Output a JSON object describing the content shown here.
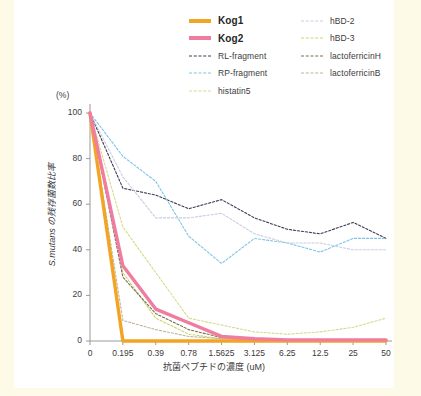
{
  "chart_data": {
    "type": "line",
    "title": "",
    "xlabel": "抗菌ペプチドの濃度 (uM)",
    "ylabel": "S.mutans の残存菌数比率",
    "y_unit": "(%)",
    "categories": [
      "0",
      "0.195",
      "0.39",
      "0.78",
      "1.5625",
      "3.125",
      "6.25",
      "12.5",
      "25",
      "50"
    ],
    "x_numeric": [
      0,
      0.195,
      0.39,
      0.78,
      1.5625,
      3.125,
      6.25,
      12.5,
      25,
      50
    ],
    "ylim": [
      0,
      100
    ],
    "yticks": [
      0,
      20,
      40,
      60,
      80,
      100
    ],
    "grid": false,
    "legend_position": "top-right",
    "series": [
      {
        "name": "Kog1",
        "color": "#F2A425",
        "style": "solid",
        "width": 3.4,
        "emphasis": true,
        "values": [
          100,
          0,
          0,
          0,
          0,
          0,
          0,
          0,
          0,
          0
        ]
      },
      {
        "name": "Kog2",
        "color": "#F07CA0",
        "style": "solid",
        "width": 3.4,
        "emphasis": true,
        "values": [
          100,
          33,
          14,
          8,
          2,
          1,
          0.5,
          0.5,
          0.5,
          0.5
        ]
      },
      {
        "name": "RL-fragment",
        "color": "#3F3B52",
        "style": "dashed",
        "width": 1.1,
        "emphasis": false,
        "values": [
          100,
          67,
          64,
          58,
          62,
          54,
          49,
          47,
          52,
          45
        ]
      },
      {
        "name": "RP-fragment",
        "color": "#7FC4E8",
        "style": "dashed",
        "width": 1.1,
        "emphasis": false,
        "values": [
          100,
          81,
          70,
          46,
          34,
          45,
          43,
          39,
          45,
          45
        ]
      },
      {
        "name": "histatin5",
        "color": "#D7DB8A",
        "style": "dashed",
        "width": 1.1,
        "emphasis": false,
        "values": [
          100,
          50,
          30,
          10,
          7,
          4,
          3,
          4,
          6,
          10
        ]
      },
      {
        "name": "hBD-2",
        "color": "#C8CEE2",
        "style": "dashed",
        "width": 1.1,
        "emphasis": false,
        "values": [
          100,
          72,
          54,
          54,
          56,
          47,
          43,
          43,
          40,
          40
        ]
      },
      {
        "name": "hBD-3",
        "color": "#C9D66B",
        "style": "dashed",
        "width": 1.1,
        "emphasis": false,
        "values": [
          100,
          30,
          10,
          3,
          1,
          0.5,
          0.5,
          0.5,
          0.5,
          0.5
        ]
      },
      {
        "name": "lactoferricinH",
        "color": "#7A6E4E",
        "style": "dashed",
        "width": 1.1,
        "emphasis": false,
        "values": [
          100,
          28,
          12,
          5,
          1.5,
          0.8,
          0.5,
          0.5,
          0.5,
          0.5
        ]
      },
      {
        "name": "lactoferricinB",
        "color": "#C0B49A",
        "style": "dashed",
        "width": 1.1,
        "emphasis": false,
        "values": [
          100,
          9,
          5,
          2,
          1,
          0.5,
          0.5,
          0.5,
          0.5,
          0.5
        ]
      }
    ]
  },
  "legend": {
    "columns": [
      {
        "items": [
          {
            "label": "Kog1",
            "color": "#F2A425",
            "style": "solid",
            "bold": true
          },
          {
            "label": "Kog2",
            "color": "#F07CA0",
            "style": "solid",
            "bold": true
          },
          {
            "label": "RL-fragment",
            "color": "#3F3B52",
            "style": "dashed",
            "bold": false
          },
          {
            "label": "RP-fragment",
            "color": "#7FC4E8",
            "style": "dashed",
            "bold": false
          },
          {
            "label": "histatin5",
            "color": "#D7DB8A",
            "style": "dashed",
            "bold": false
          }
        ]
      },
      {
        "items": [
          {
            "label": "hBD-2",
            "color": "#C8CEE2",
            "style": "dashed",
            "bold": false
          },
          {
            "label": "hBD-3",
            "color": "#C9D66B",
            "style": "dashed",
            "bold": false
          },
          {
            "label": "lactoferricinH",
            "color": "#7A6E4E",
            "style": "dashed",
            "bold": false
          },
          {
            "label": "lactoferricinB",
            "color": "#C0B49A",
            "style": "dashed",
            "bold": false
          }
        ]
      }
    ]
  },
  "colors": {
    "page_background": "#fdfbe8",
    "panel_background": "#ffffff",
    "axis": "#9a9a9a",
    "text": "#3b3b3b"
  }
}
